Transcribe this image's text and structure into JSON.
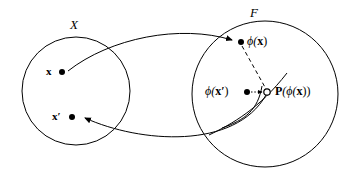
{
  "figure": {
    "background_color": "#ffffff",
    "stroke_color": "#000000",
    "width": 342,
    "height": 179
  },
  "sets": [
    {
      "id": "input-space",
      "label": "X",
      "cx": 76,
      "cy": 91,
      "r": 54
    },
    {
      "id": "feature-space",
      "label": "F",
      "cx": 265,
      "cy": 94,
      "r": 73
    }
  ],
  "points": [
    {
      "id": "x",
      "label": "x",
      "marker": "filled-dot",
      "cx": 62,
      "cy": 72
    },
    {
      "id": "x-prime",
      "label": "x′",
      "marker": "filled-dot",
      "cx": 72,
      "cy": 117
    },
    {
      "id": "phi-x",
      "label": "ϕ(x)",
      "marker": "filled-dot",
      "cx": 241,
      "cy": 42
    },
    {
      "id": "phi-x-prime",
      "label": "ϕ(x′)",
      "marker": "filled-dot",
      "cx": 247,
      "cy": 92
    },
    {
      "id": "projection",
      "label": "P(ϕ(x))",
      "marker": "open-dot",
      "cx": 267,
      "cy": 92
    }
  ],
  "labels": {
    "input_space": "X",
    "feature_space": "F",
    "point_x": "x",
    "point_x_prime": "x′",
    "phi_x_open": "ϕ(",
    "phi_x_arg": "x",
    "phi_x_close": ")",
    "phi_xp_open": "ϕ(",
    "phi_xp_arg": "x′",
    "phi_xp_close": ")",
    "proj_p": "P",
    "proj_open": "(ϕ(",
    "proj_arg": "x",
    "proj_close": "))"
  },
  "connections": [
    {
      "id": "map-forward",
      "from": "x",
      "to": "phi-x",
      "style": "solid-arrow",
      "description": "feature map arrow from x to phi(x)"
    },
    {
      "id": "map-backward",
      "from": "projection",
      "to": "x-prime",
      "style": "solid-arrow",
      "description": "pre-image arrow from P(phi(x)) back to x-prime"
    },
    {
      "id": "projection-line",
      "from": "phi-x",
      "to": "projection",
      "style": "dashed",
      "description": "dashed projection of phi(x) onto the manifold"
    },
    {
      "id": "distance-line",
      "from": "phi-x-prime",
      "to": "projection",
      "style": "dotted-arrow",
      "description": "dotted line between phi(x-prime) and the projection point"
    }
  ],
  "manifold": {
    "id": "manifold-curve",
    "description": "curve through the projection point inside the feature space",
    "style": "solid"
  }
}
